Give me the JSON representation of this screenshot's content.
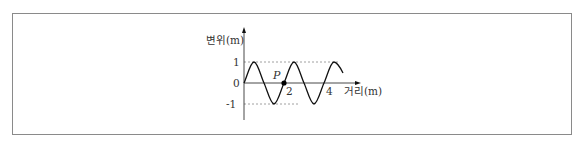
{
  "diagram": {
    "type": "transverse-wave-graph",
    "y_axis": {
      "label": "변위(m)",
      "ticks": [
        "1",
        "0",
        "-1"
      ]
    },
    "x_axis": {
      "label": "거리(m)",
      "ticks": [
        "2",
        "4"
      ]
    },
    "point": {
      "label": "P",
      "x_m": 2,
      "y_m": 0
    },
    "wave": {
      "amplitude_m": 1,
      "wavelength_m": 2,
      "x_start_m": 0,
      "x_end_m": 4.95
    },
    "colors": {
      "curve": "#111111",
      "axis": "#333333",
      "dashed": "#888888",
      "frame": "#8a8a8a"
    }
  }
}
